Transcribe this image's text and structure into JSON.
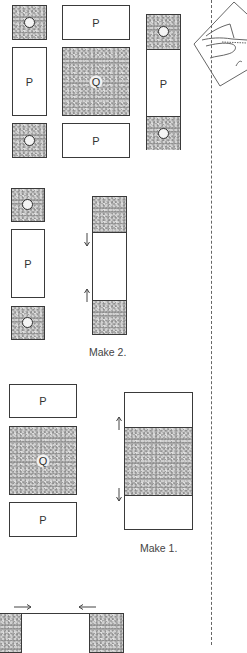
{
  "diagram": {
    "type": "quilt-block-assembly",
    "fabric_legend": {
      "O": "small grey print square",
      "P": "white rectangle",
      "Q": "large grey print square"
    },
    "colors": {
      "outline": "#3a3a3a",
      "print_fabric": "#a9a9a9",
      "background_fabric": "#ffffff",
      "fold_line": "#666666"
    },
    "step1": {
      "left_column": [
        {
          "label": "O",
          "fabric": "print"
        },
        {
          "label": "P",
          "fabric": "white"
        },
        {
          "label": "O",
          "fabric": "print"
        }
      ],
      "center_column": [
        {
          "label": "P",
          "fabric": "white"
        },
        {
          "label": "Q",
          "fabric": "print"
        },
        {
          "label": "P",
          "fabric": "white"
        }
      ],
      "right_column": [
        {
          "label": "O",
          "fabric": "print"
        },
        {
          "label": "P",
          "fabric": "white"
        },
        {
          "label": "O",
          "fabric": "print"
        }
      ]
    },
    "step2": {
      "pieces": [
        {
          "label": "O",
          "fabric": "print"
        },
        {
          "label": "P",
          "fabric": "white"
        },
        {
          "label": "O",
          "fabric": "print"
        }
      ],
      "pressing": "arrows toward O squares",
      "caption": "Make 2."
    },
    "step3": {
      "pieces": [
        {
          "label": "P",
          "fabric": "white"
        },
        {
          "label": "Q",
          "fabric": "print"
        },
        {
          "label": "P",
          "fabric": "white"
        }
      ],
      "pressing": "arrows toward Q square",
      "caption": "Make 1."
    },
    "step4": {
      "pressing": "arrows toward center strip"
    },
    "sidebar_illustration": "hands folding fabric square on the diagonal",
    "fold_line": "dashed vertical"
  }
}
